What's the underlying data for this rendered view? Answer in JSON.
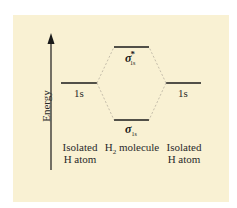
{
  "diagram": {
    "axis_label": "Energy",
    "levels": {
      "left_atomic": "1s",
      "right_atomic": "1s",
      "antibonding": {
        "symbol": "σ",
        "subscript": "1s",
        "superscript": "*"
      },
      "bonding": {
        "symbol": "σ",
        "subscript": "1s"
      }
    },
    "columns": {
      "left": [
        "Isolated",
        "H atom"
      ],
      "middle": {
        "prefix": "H",
        "subscript": "2",
        "suffix": " molecule"
      },
      "right": [
        "Isolated",
        "H atom"
      ]
    },
    "colors": {
      "background": "#f9f1d3",
      "lines": "#1a1a1a",
      "dashed": "#b8b0a0"
    }
  }
}
